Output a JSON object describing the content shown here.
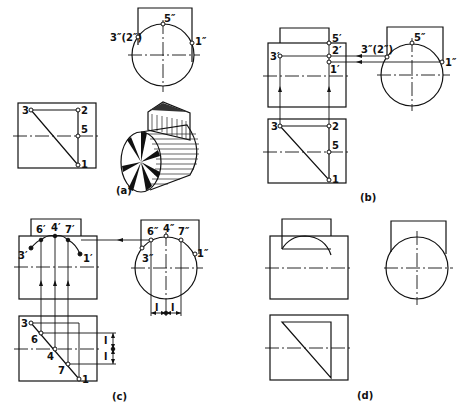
{
  "figure": {
    "panels": [
      {
        "id": "a",
        "caption": "(a)"
      },
      {
        "id": "b",
        "caption": "(b)"
      },
      {
        "id": "c",
        "caption": "(c)"
      },
      {
        "id": "d",
        "caption": "(d)"
      }
    ],
    "labels": {
      "a": {
        "side": {
          "p5": "5″",
          "p32": "3″(2″)",
          "p1": "1″"
        },
        "top": {
          "p3": "3",
          "p2": "2",
          "p5": "5",
          "p1": "1"
        }
      },
      "b": {
        "front": {
          "p5": "5′",
          "p3": "3′",
          "p2": "2′",
          "p1": "1′"
        },
        "side": {
          "p32": "3″(2″)",
          "p5": "5″",
          "p1": "1″"
        },
        "top": {
          "p3": "3",
          "p2": "2",
          "p5": "5",
          "p1": "1"
        }
      },
      "c": {
        "front": {
          "p6": "6′",
          "p4": "4′",
          "p7": "7′",
          "p3": "3′",
          "p1": "1′"
        },
        "side": {
          "p6": "6″",
          "p4": "4″",
          "p7": "7″",
          "p3": "3″",
          "p1": "1″"
        },
        "top": {
          "p3": "3",
          "p6": "6",
          "p4": "4",
          "p7": "7",
          "p1": "1"
        },
        "dims": {
          "l": "l"
        }
      }
    }
  }
}
